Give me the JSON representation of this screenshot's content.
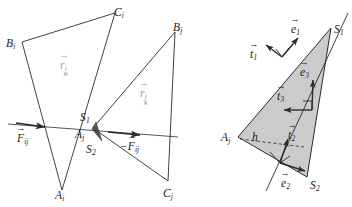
{
  "figure": {
    "type": "geometry-diagram",
    "panels": [
      {
        "id": "left",
        "name": "two-triangles-contact-force",
        "description": "Two overlapping triangles i and j intersecting along a line with contact points S1 and S2 and opposing forces"
      },
      {
        "id": "right",
        "name": "shaded-overlap-triangle-vectors",
        "description": "Shaded overlap triangle with edge normals e1,e2,e3 and tangents t1,t2,t3 and height h"
      }
    ]
  },
  "labels": {
    "left": {
      "B_i": {
        "base": "B",
        "sub": "i"
      },
      "C_i": {
        "base": "C",
        "sub": "i"
      },
      "A_i": {
        "base": "A",
        "sub": "i"
      },
      "B_j": {
        "base": "B",
        "sub": "j"
      },
      "C_j": {
        "base": "C",
        "sub": "j"
      },
      "A_j": {
        "base": "A",
        "sub": "j"
      },
      "S_1": {
        "base": "S",
        "sub": "1"
      },
      "S_2": {
        "base": "S",
        "sub": "2"
      },
      "r_i": {
        "base": "r",
        "sub": "i",
        "accent": "→"
      },
      "r_j": {
        "base": "r",
        "sub": "j",
        "accent": "→"
      },
      "F_ij": {
        "base": "F",
        "sub": "ij",
        "accent": "→"
      },
      "F_ij_neg": {
        "prefix": "−",
        "base": "F",
        "sub": "ij",
        "accent": "→"
      },
      "centroid_mark_i": "×",
      "centroid_mark_j": "×"
    },
    "right": {
      "A_j": {
        "base": "A",
        "sub": "j"
      },
      "S_1": {
        "base": "S",
        "sub": "1"
      },
      "S_2": {
        "base": "S",
        "sub": "2"
      },
      "e_1": {
        "base": "e",
        "sub": "1",
        "accent": "→"
      },
      "e_2": {
        "base": "e",
        "sub": "2",
        "accent": "→"
      },
      "e_3": {
        "base": "e",
        "sub": "3",
        "accent": "→"
      },
      "t_1": {
        "base": "t",
        "sub": "1",
        "accent": "→"
      },
      "t_2": {
        "base": "t",
        "sub": "2",
        "accent": "→"
      },
      "t_3": {
        "base": "t",
        "sub": "3",
        "accent": "→"
      },
      "h": {
        "base": "h",
        "sub": ""
      }
    }
  },
  "colors": {
    "stroke": "#2b2b2b",
    "shade_fill": "#cccccc",
    "gray_text": "#9a9a9a",
    "background": "#ffffff"
  },
  "geometry": {
    "left": {
      "triangle_i": {
        "A": [
          62,
          190
        ],
        "B": [
          22,
          42
        ],
        "C": [
          115,
          13
        ]
      },
      "triangle_j": {
        "A": [
          93,
          128
        ],
        "B": [
          175,
          32
        ],
        "C": [
          168,
          181
        ]
      },
      "contact_line": [
        [
          8,
          124
        ],
        [
          178,
          137
        ]
      ],
      "S1": [
        97,
        123
      ],
      "S2": [
        101,
        140
      ]
    },
    "right": {
      "overlap_triangle": {
        "A": [
          238,
          137
        ],
        "S1": [
          331,
          28
        ],
        "S2": [
          307,
          177
        ]
      },
      "cut_line": [
        [
          268,
          188
        ],
        [
          348,
          14
        ]
      ],
      "dashed_height": [
        [
          240,
          139
        ],
        [
          303,
          146
        ]
      ]
    }
  }
}
